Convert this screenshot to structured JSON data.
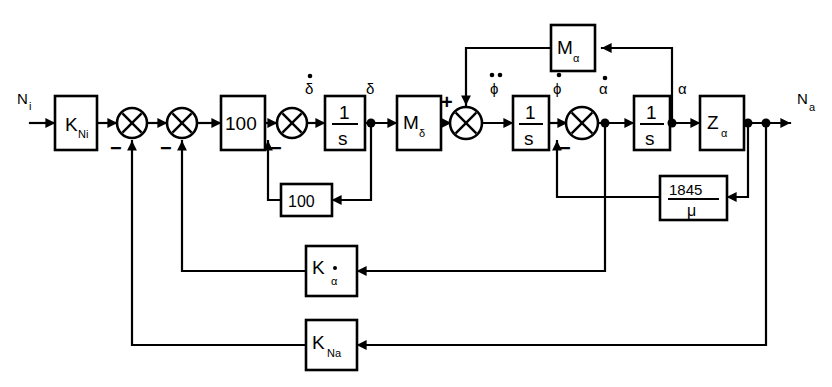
{
  "figure": {
    "type": "block-diagram",
    "domain": "control-system",
    "background_color": "#ffffff",
    "line_color": "#000000"
  },
  "signals": {
    "input": "N",
    "input_sub": "i",
    "output": "N",
    "output_sub": "a",
    "delta_dot": "δ",
    "delta": "δ",
    "phi_ddot": "ϕ",
    "phi_dot": "ϕ",
    "alpha_dot": "α",
    "alpha": "α"
  },
  "blocks": [
    {
      "id": "k-ni",
      "label": "K",
      "sub": "Ni",
      "x": 55,
      "y": 96,
      "w": 42,
      "h": 54
    },
    {
      "id": "gain-100",
      "label": "100",
      "sub": "",
      "x": 221,
      "y": 96,
      "w": 44,
      "h": 54
    },
    {
      "id": "int-1",
      "label": "1/s",
      "sub": "",
      "x": 325,
      "y": 96,
      "w": 40,
      "h": 54
    },
    {
      "id": "m-delta",
      "label": "M",
      "sub": "δ",
      "x": 397,
      "y": 96,
      "w": 44,
      "h": 54
    },
    {
      "id": "int-2",
      "label": "1/s",
      "sub": "",
      "x": 513,
      "y": 96,
      "w": 36,
      "h": 54
    },
    {
      "id": "int-3",
      "label": "1/s",
      "sub": "",
      "x": 634,
      "y": 96,
      "w": 36,
      "h": 54
    },
    {
      "id": "z-alpha",
      "label": "Z",
      "sub": "α",
      "x": 700,
      "y": 96,
      "w": 44,
      "h": 54
    },
    {
      "id": "m-alpha",
      "label": "M",
      "sub": "α",
      "x": 551,
      "y": 25,
      "w": 44,
      "h": 46
    },
    {
      "id": "fb-100",
      "label": "100",
      "sub": "",
      "x": 281,
      "y": 184,
      "w": 44,
      "h": 32
    },
    {
      "id": "fb-1845",
      "label": "1845",
      "sub": "μ",
      "x": 660,
      "y": 176,
      "w": 60,
      "h": 42
    },
    {
      "id": "k-alphadot",
      "label": "K",
      "sub": "α",
      "x": 306,
      "y": 246,
      "w": 44,
      "h": 50
    },
    {
      "id": "k-na",
      "label": "K",
      "sub": "Na",
      "x": 306,
      "y": 320,
      "w": 44,
      "h": 50
    }
  ],
  "block_labels": {
    "k_ni": "K",
    "k_ni_sub": "Ni",
    "gain_100": "100",
    "integrator_num": "1",
    "integrator_den": "s",
    "m_delta": "M",
    "m_delta_sub": "δ",
    "m_alpha": "M",
    "m_alpha_sub": "α",
    "z_alpha": "Z",
    "z_alpha_sub": "α",
    "fb_100": "100",
    "fb_1845_num": "1845",
    "fb_1845_den": "μ",
    "k_alphadot": "K",
    "k_alphadot_sub": "α",
    "k_na": "K",
    "k_na_sub": "Na"
  },
  "summing_junctions": [
    {
      "id": "sum-1",
      "cx": 132,
      "cy": 123,
      "r": 15,
      "signs": [
        {
          "text": "−",
          "x": 114,
          "y": 152
        }
      ]
    },
    {
      "id": "sum-2",
      "cx": 182,
      "cy": 123,
      "r": 15,
      "signs": [
        {
          "text": "−",
          "x": 164,
          "y": 152
        }
      ]
    },
    {
      "id": "sum-3",
      "cx": 292,
      "cy": 123,
      "r": 15,
      "signs": [
        {
          "text": "−",
          "x": 274,
          "y": 152
        }
      ]
    },
    {
      "id": "sum-4",
      "cx": 466,
      "cy": 123,
      "r": 16,
      "signs": [
        {
          "text": "+",
          "x": 447,
          "y": 104
        }
      ]
    },
    {
      "id": "sum-5",
      "cx": 582,
      "cy": 123,
      "r": 16,
      "signs": [
        {
          "text": "−",
          "x": 563,
          "y": 152
        }
      ]
    }
  ],
  "signal_labels": [
    {
      "id": "in-ni",
      "text": "N",
      "sub": "i",
      "x": 22,
      "y": 104
    },
    {
      "id": "deltadot-lbl",
      "text": "δ",
      "dot": 1,
      "x": 311,
      "y": 92
    },
    {
      "id": "delta-lbl",
      "text": "δ",
      "dot": 0,
      "x": 371,
      "y": 92
    },
    {
      "id": "phiddot-lbl",
      "text": "ϕ",
      "dot": 2,
      "x": 497,
      "y": 92
    },
    {
      "id": "phidot-lbl",
      "text": "ϕ",
      "dot": 1,
      "x": 560,
      "y": 92
    },
    {
      "id": "alphadot-lbl",
      "text": "α",
      "dot": 1,
      "x": 611,
      "y": 92
    },
    {
      "id": "alpha-lbl",
      "text": "α",
      "dot": 0,
      "x": 683,
      "y": 92
    },
    {
      "id": "out-na",
      "text": "N",
      "sub": "a",
      "x": 800,
      "y": 104
    }
  ],
  "nodes": [
    {
      "id": "node-delta",
      "cx": 371,
      "cy": 123
    },
    {
      "id": "node-alphadot",
      "cx": 605,
      "cy": 123
    },
    {
      "id": "node-alpha",
      "cx": 672,
      "cy": 123
    },
    {
      "id": "node-out-1",
      "cx": 748,
      "cy": 123
    },
    {
      "id": "node-out-2",
      "cx": 766,
      "cy": 123
    }
  ],
  "feedback_paths": [
    {
      "id": "path-delta-100",
      "from": "node-delta",
      "through": "fb-100",
      "to": "sum-3"
    },
    {
      "id": "path-alpha-1845",
      "from": "node-out-1",
      "through": "fb-1845",
      "to": "sum-5"
    },
    {
      "id": "path-alphadot-k",
      "from": "node-alphadot",
      "through": "k-alphadot",
      "to": "sum-2"
    },
    {
      "id": "path-na-kna",
      "from": "node-out-2",
      "through": "k-na",
      "to": "sum-1"
    },
    {
      "id": "path-alpha-malpha",
      "from": "node-alpha",
      "through": "m-alpha",
      "to": "sum-4"
    }
  ]
}
